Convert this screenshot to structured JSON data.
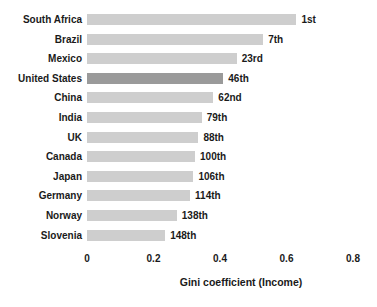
{
  "chart_data": {
    "type": "bar",
    "orientation": "horizontal",
    "title": "",
    "xlabel": "Gini coefficient (Income)",
    "ylabel": "",
    "categories": [
      "South Africa",
      "Brazil",
      "Mexico",
      "United States",
      "China",
      "India",
      "UK",
      "Canada",
      "Japan",
      "Germany",
      "Norway",
      "Slovenia"
    ],
    "values": [
      0.63,
      0.53,
      0.45,
      0.41,
      0.38,
      0.345,
      0.335,
      0.325,
      0.32,
      0.31,
      0.27,
      0.235
    ],
    "rank_labels": [
      "1st",
      "7th",
      "23rd",
      "46th",
      "62nd",
      "79th",
      "88th",
      "100th",
      "106th",
      "114th",
      "138th",
      "148th"
    ],
    "highlighted_category": "United States",
    "xlim": [
      0,
      0.8
    ],
    "xticks": [
      0,
      0.2,
      0.4,
      0.6,
      0.8
    ],
    "xtick_labels": [
      "0",
      "0.2",
      "0.4",
      "0.6",
      "0.8"
    ],
    "grid": false,
    "legend": false,
    "colors": {
      "bar": "#cecece",
      "highlight_bar": "#9a9a9a",
      "text": "#1a1a1a",
      "background": "#ffffff"
    }
  }
}
